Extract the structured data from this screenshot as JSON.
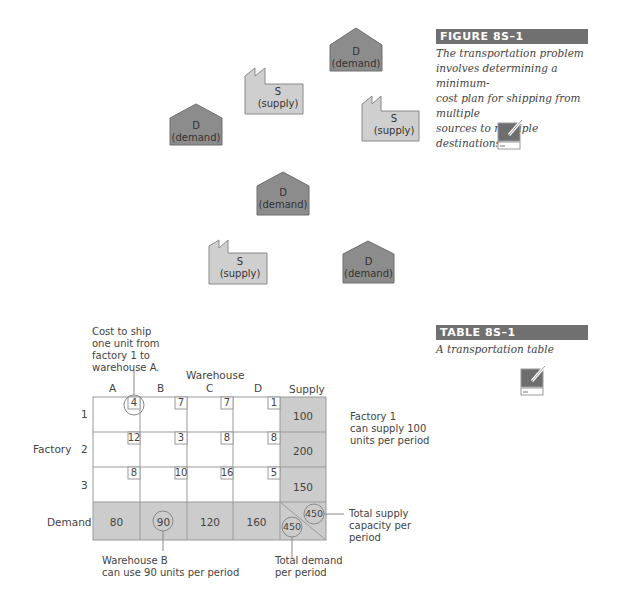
{
  "figure": {
    "label": "FIGURE 8S–1",
    "caption": "The transportation problem involves determining a minimum-cost plan for shipping from multiple sources to multiple destinations",
    "caption_lines": [
      "The transportation problem",
      "involves determining a minimum-",
      "cost plan for shipping from multiple",
      "sources to multiple destinations"
    ],
    "icon": "computer-tutorial-icon",
    "nodes": [
      {
        "type": "demand",
        "letter": "D",
        "label": "(demand)"
      },
      {
        "type": "supply",
        "letter": "S",
        "label": "(supply)"
      },
      {
        "type": "demand",
        "letter": "D",
        "label": "(demand)"
      },
      {
        "type": "supply",
        "letter": "S",
        "label": "(supply)"
      },
      {
        "type": "demand",
        "letter": "D",
        "label": "(demand)"
      },
      {
        "type": "supply",
        "letter": "S",
        "label": "(supply)"
      },
      {
        "type": "demand",
        "letter": "D",
        "label": "(demand)"
      }
    ]
  },
  "table": {
    "label": "TABLE 8S–1",
    "caption": "A transportation table",
    "icon": "computer-tutorial-icon",
    "warehouse_header": "Warehouse",
    "factory_header": "Factory",
    "columns": [
      "A",
      "B",
      "C",
      "D"
    ],
    "supply_header": "Supply",
    "demand_label": "Demand",
    "rows": [
      {
        "factory": "1",
        "costs": [
          "4",
          "7",
          "7",
          "1"
        ],
        "supply": "100"
      },
      {
        "factory": "2",
        "costs": [
          "12",
          "3",
          "8",
          "8"
        ],
        "supply": "200"
      },
      {
        "factory": "3",
        "costs": [
          "8",
          "10",
          "16",
          "5"
        ],
        "supply": "150"
      }
    ],
    "demand": [
      "80",
      "90",
      "120",
      "160"
    ],
    "total_supply": "450",
    "total_demand": "450",
    "annotations": {
      "cost": [
        "Cost to ship",
        "one unit from",
        "factory 1 to",
        "warehouse A."
      ],
      "factory_supply": [
        "Factory 1",
        "can supply 100",
        "units per period"
      ],
      "total_supply": [
        "Total supply",
        "capacity per",
        "period"
      ],
      "warehouse_demand": [
        "Warehouse B",
        "can use 90 units per period"
      ],
      "total_demand": [
        "Total demand",
        "per period"
      ]
    }
  },
  "colors": {
    "label_bg": "#707070",
    "demand_fill": "#8c8c8c",
    "supply_fill": "#cfcfcf",
    "shaded_cell": "#cccccc",
    "grid_line": "#9a9a9a"
  }
}
